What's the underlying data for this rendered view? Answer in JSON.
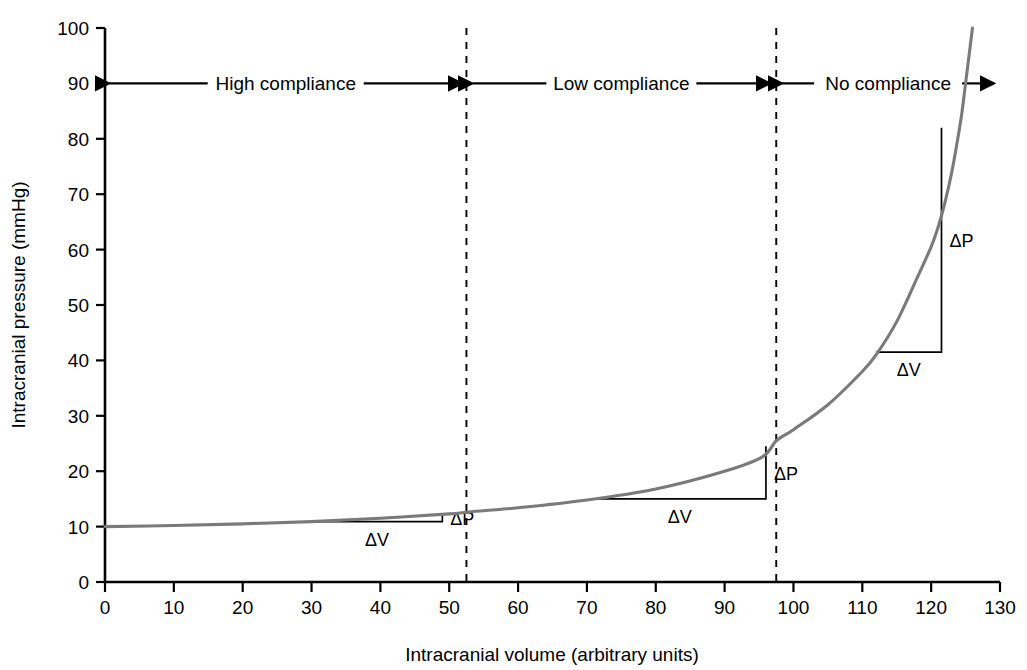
{
  "chart_data": {
    "type": "line",
    "title": "",
    "subtitle": "",
    "xlabel": "Intracranial volume (arbitrary units)",
    "ylabel": "Intracranial pressure (mmHg)",
    "xlim": [
      0,
      130
    ],
    "ylim": [
      0,
      100
    ],
    "xticks": [
      0,
      10,
      20,
      30,
      40,
      50,
      60,
      70,
      80,
      90,
      100,
      110,
      120,
      130
    ],
    "yticks": [
      0,
      10,
      20,
      30,
      40,
      50,
      60,
      70,
      80,
      90,
      100
    ],
    "xtick_labels": [
      "0",
      "10",
      "20",
      "30",
      "40",
      "50",
      "60",
      "70",
      "80",
      "90",
      "100",
      "110",
      "120",
      "130"
    ],
    "ytick_labels": [
      "0",
      "10",
      "20",
      "30",
      "40",
      "50",
      "60",
      "70",
      "80",
      "90",
      "100"
    ],
    "grid": false,
    "legend": false,
    "legend_position": "none",
    "curve_color": "#7a7a7a",
    "axis_color": "#000000",
    "series": [
      {
        "name": "Intracranial pressure-volume curve",
        "points": [
          [
            0,
            10.0
          ],
          [
            10,
            10.2
          ],
          [
            20,
            10.5
          ],
          [
            30,
            10.9
          ],
          [
            40,
            11.5
          ],
          [
            50,
            12.3
          ],
          [
            52.5,
            12.6
          ],
          [
            60,
            13.4
          ],
          [
            70,
            14.8
          ],
          [
            80,
            16.8
          ],
          [
            90,
            20.0
          ],
          [
            95.5,
            22.6
          ],
          [
            97.5,
            25.5
          ],
          [
            100,
            27.5
          ],
          [
            105,
            32.0
          ],
          [
            110,
            38.0
          ],
          [
            112,
            41.0
          ],
          [
            115,
            47.0
          ],
          [
            118,
            55.0
          ],
          [
            120,
            60.5
          ],
          [
            121,
            64.0
          ],
          [
            122,
            68.5
          ],
          [
            123,
            74.0
          ],
          [
            124,
            81.0
          ],
          [
            124.5,
            85.0
          ],
          [
            125,
            90.0
          ],
          [
            125.5,
            95.0
          ],
          [
            126,
            100.0
          ]
        ]
      }
    ],
    "dividers": [
      {
        "name": "high-low-divider",
        "x": 52.5,
        "style": "dashed"
      },
      {
        "name": "low-no-divider",
        "x": 97.5,
        "style": "dashed"
      }
    ],
    "regions": [
      {
        "label": "High compliance",
        "x_start": 0,
        "x_end": 52.5,
        "y": 90
      },
      {
        "label": "Low compliance",
        "x_start": 52.5,
        "x_end": 97.5,
        "y": 90
      },
      {
        "label": "No compliance",
        "x_start": 97.5,
        "x_end": 130,
        "y": 90
      }
    ],
    "annotations": [
      {
        "name": "slope-triangle-high-compliance",
        "delta_v_label": "ΔV",
        "delta_p_label": "ΔP",
        "x_start": 30,
        "x_end": 49,
        "y_low": 10.9,
        "y_high": 12.2
      },
      {
        "name": "slope-triangle-low-compliance",
        "delta_v_label": "ΔV",
        "delta_p_label": "ΔP",
        "x_start": 71,
        "x_end": 96,
        "y_low": 15.0,
        "y_high": 24.5
      },
      {
        "name": "slope-triangle-no-compliance",
        "delta_v_label": "ΔV",
        "delta_p_label": "ΔP",
        "x_start": 112,
        "x_end": 121.5,
        "y_low": 41.5,
        "y_high": 82.0
      }
    ]
  },
  "axes": {
    "x_title": "Intracranial volume (arbitrary units)",
    "y_title": "Intracranial pressure (mmHg)"
  },
  "ticks": {
    "x": [
      "0",
      "10",
      "20",
      "30",
      "40",
      "50",
      "60",
      "70",
      "80",
      "90",
      "100",
      "110",
      "120",
      "130"
    ],
    "y": [
      "0",
      "10",
      "20",
      "30",
      "40",
      "50",
      "60",
      "70",
      "80",
      "90",
      "100"
    ]
  },
  "regions": {
    "high": "High compliance",
    "low": "Low compliance",
    "no": "No compliance"
  },
  "deltas": {
    "p": "ΔP",
    "v": "ΔV"
  }
}
